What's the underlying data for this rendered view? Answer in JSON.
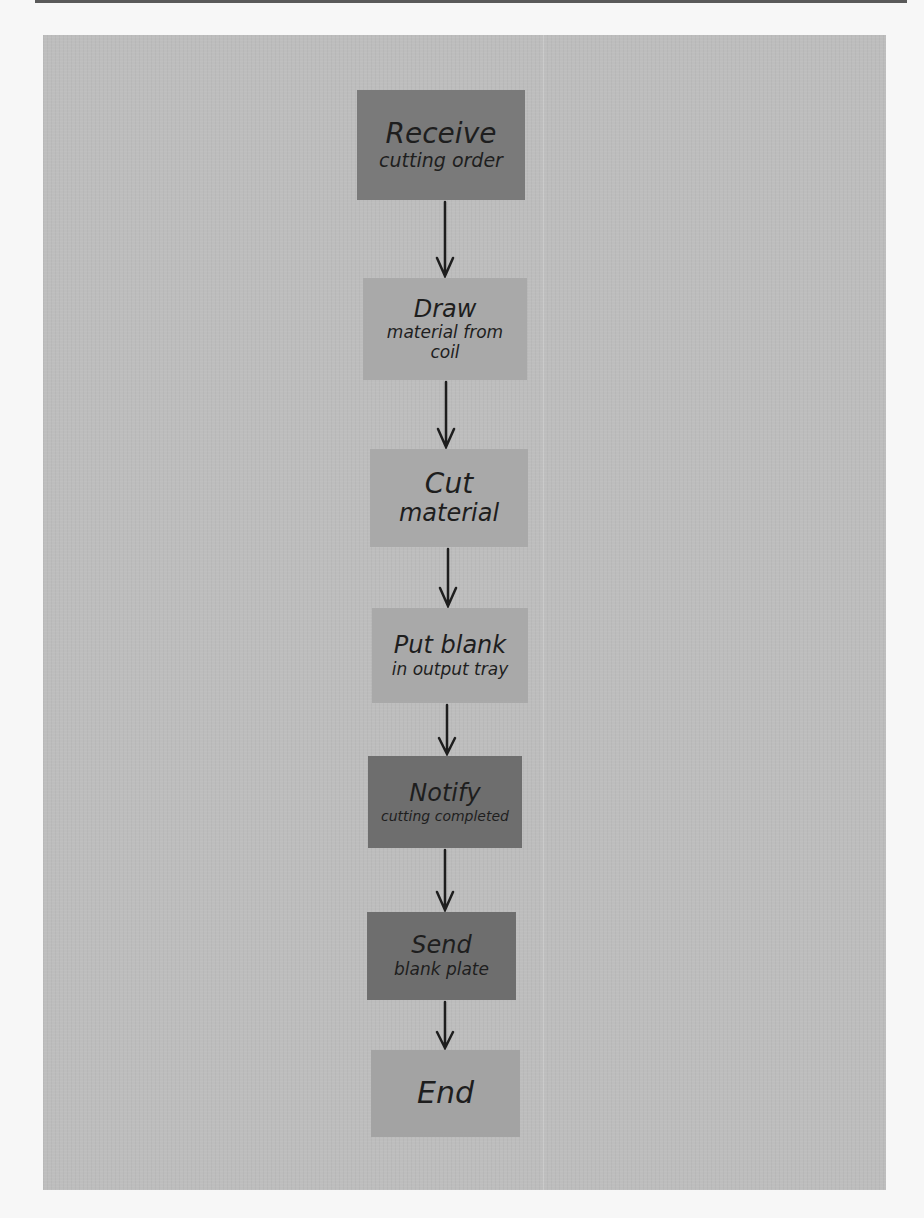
{
  "diagram": {
    "type": "flowchart",
    "orientation": "vertical",
    "style": "handwritten on gray paper",
    "nodes": [
      {
        "id": "n1",
        "line1": "Receive",
        "line2": "cutting order",
        "shade": "#7a7a7a"
      },
      {
        "id": "n2",
        "line1": "Draw",
        "line2": "material from coil",
        "shade": "#a9a9a9"
      },
      {
        "id": "n3",
        "line1": "Cut",
        "line2": "material",
        "shade": "#a9a9a9"
      },
      {
        "id": "n4",
        "line1": "Put blank",
        "line2": "in output tray",
        "shade": "#a9a9a9"
      },
      {
        "id": "n5",
        "line1": "Notify",
        "line2": "cutting completed",
        "shade": "#6e6e6e"
      },
      {
        "id": "n6",
        "line1": "Send",
        "line2": "blank plate",
        "shade": "#6e6e6e"
      },
      {
        "id": "n7",
        "line1": "End",
        "line2": "",
        "shade": "#a3a3a3"
      }
    ],
    "edges": [
      {
        "from": "n1",
        "to": "n2"
      },
      {
        "from": "n2",
        "to": "n3"
      },
      {
        "from": "n3",
        "to": "n4"
      },
      {
        "from": "n4",
        "to": "n5"
      },
      {
        "from": "n5",
        "to": "n6"
      },
      {
        "from": "n6",
        "to": "n7"
      }
    ]
  }
}
